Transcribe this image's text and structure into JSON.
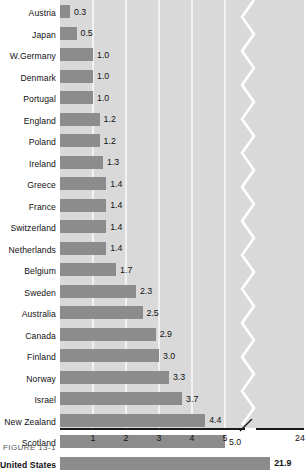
{
  "chart_data": {
    "type": "bar",
    "orientation": "horizontal",
    "title": "",
    "subtitle": "",
    "xlabel": "",
    "ylabel": "",
    "categories": [
      "Austria",
      "Japan",
      "W.Germany",
      "Denmark",
      "Portugal",
      "England",
      "Poland",
      "Ireland",
      "Greece",
      "France",
      "Switzerland",
      "Netherlands",
      "Belgium",
      "Sweden",
      "Australia",
      "Canada",
      "Finland",
      "Norway",
      "Israel",
      "New Zealand",
      "Scotland",
      "United States"
    ],
    "values": [
      0.3,
      0.5,
      1.0,
      1.0,
      1.0,
      1.2,
      1.2,
      1.3,
      1.4,
      1.4,
      1.4,
      1.4,
      1.7,
      2.3,
      2.5,
      2.9,
      3.0,
      3.3,
      3.7,
      4.4,
      5.0,
      21.9
    ],
    "value_labels": [
      "0.3",
      "0.5",
      "1.0",
      "1.0",
      "1.0",
      "1.2",
      "1.2",
      "1.3",
      "1.4",
      "1.4",
      "1.4",
      "1.4",
      "1.7",
      "2.3",
      "2.5",
      "2.9",
      "3.0",
      "3.3",
      "3.7",
      "4.4",
      "5.0",
      "21.9"
    ],
    "emphasized_category": "United States",
    "xticks": [
      1,
      2,
      3,
      4,
      5,
      24
    ],
    "xtick_labels": [
      "1",
      "2",
      "3",
      "4",
      "5",
      "24"
    ],
    "xlim": [
      0,
      24
    ],
    "axis_break": true,
    "axis_break_after": 5.6,
    "grid": true,
    "legend": null,
    "colors": {
      "bar": "#8c8c8c",
      "plot_background": "#d9d9d9",
      "gridline": "#f2f2f2",
      "axis": "#1a1a1a",
      "text": "#111111",
      "page_background": "#ffffff"
    }
  },
  "caption": {
    "text": "FIGURE 13-1"
  }
}
